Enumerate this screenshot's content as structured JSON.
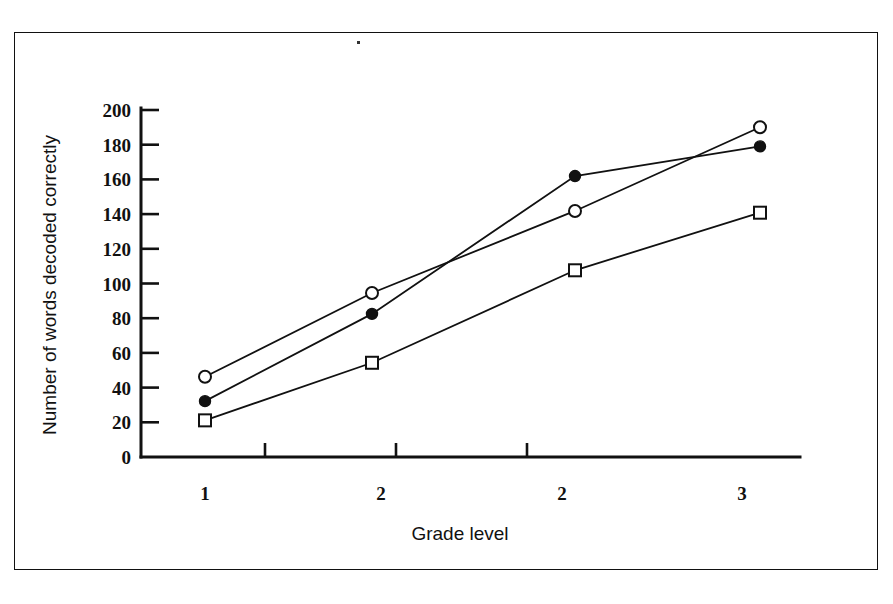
{
  "figure": {
    "background_color": "#ffffff",
    "ink_color": "#111111",
    "border": "thin rectangular scanned page frame"
  },
  "chart_data": {
    "type": "line",
    "title": "",
    "subtitle": "",
    "xlabel": "Grade level",
    "ylabel": "Number of words decoded correctly",
    "x": [
      1,
      2,
      3,
      4
    ],
    "categories": [
      "1",
      "2",
      "2",
      "3"
    ],
    "xtick_labels": [
      "1",
      "2",
      "2",
      "3"
    ],
    "ytick_labels": [
      "0",
      "20",
      "40",
      "60",
      "80",
      "100",
      "120",
      "140",
      "160",
      "180",
      "200"
    ],
    "ytick_values": [
      0,
      20,
      40,
      60,
      80,
      100,
      120,
      140,
      160,
      180,
      200
    ],
    "ylim": [
      0,
      200
    ],
    "grid": false,
    "legend": "none",
    "series": [
      {
        "name": "open-circle-series",
        "marker": "open-circle",
        "values": [
          46,
          94,
          141,
          189
        ]
      },
      {
        "name": "filled-circle-series",
        "marker": "filled-circle",
        "values": [
          32,
          82,
          161,
          178
        ]
      },
      {
        "name": "open-square-series",
        "marker": "open-square",
        "values": [
          21,
          54,
          107,
          140
        ]
      }
    ]
  },
  "axis": {
    "y_label_text": "Number of words decoded correctly",
    "x_label_text": "Grade level",
    "y_ticks": [
      {
        "label": "200"
      },
      {
        "label": "180"
      },
      {
        "label": "160"
      },
      {
        "label": "140"
      },
      {
        "label": "120"
      },
      {
        "label": "100"
      },
      {
        "label": "80"
      },
      {
        "label": "60"
      },
      {
        "label": "40"
      },
      {
        "label": "20"
      },
      {
        "label": "0"
      }
    ],
    "x_ticks": [
      {
        "label": "1"
      },
      {
        "label": "2"
      },
      {
        "label": "2"
      },
      {
        "label": "3"
      }
    ]
  }
}
